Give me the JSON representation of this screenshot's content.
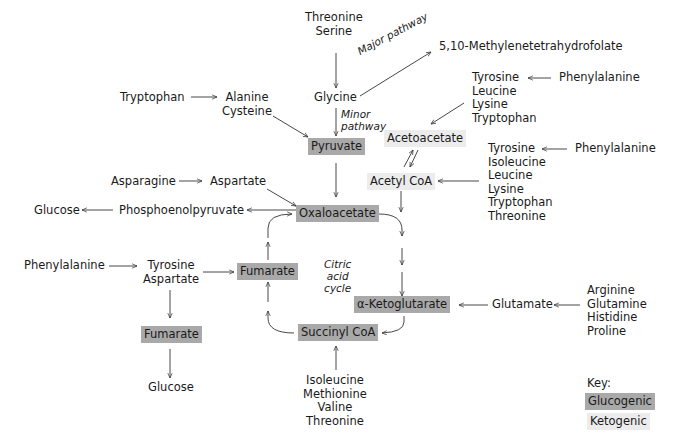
{
  "diagram": {
    "top": {
      "threonine_serine": [
        "Threonine",
        "Serine"
      ],
      "glycine": "Glycine",
      "major_pathway": "Major pathway",
      "minor_pathway": [
        "Minor",
        "pathway"
      ],
      "methylene": "5,10-Methylenetetrahydrofolate",
      "tryptophan": "Tryptophan",
      "alanine_cysteine": [
        "Alanine",
        "Cysteine"
      ]
    },
    "ketogenic_group1": {
      "amino_acids": [
        "Tyrosine",
        "Leucine",
        "Lysine",
        "Tryptophan"
      ],
      "precursor": "Phenylalanine"
    },
    "ketogenic_group2": {
      "amino_acids": [
        "Tyrosine",
        "Isoleucine",
        "Leucine",
        "Lysine",
        "Tryptophan",
        "Threonine"
      ],
      "precursor": "Phenylalanine"
    },
    "boxes": {
      "pyruvate": "Pyruvate",
      "acetoacetate": "Acetoacetate",
      "acetyl_coa": "Acetyl CoA",
      "oxaloacetate": "Oxaloacetate",
      "fumarate_cycle": "Fumarate",
      "fumarate_side": "Fumarate",
      "alpha_ketoglutarate": "α-Ketoglutarate",
      "succinyl_coa": "Succinyl CoA"
    },
    "left": {
      "asparagine": "Asparagine",
      "aspartate": "Aspartate",
      "glucose_top": "Glucose",
      "pep": "Phosphoenolpyruvate",
      "phenylalanine": "Phenylalanine",
      "tyrosine_aspartate": [
        "Tyrosine",
        "Aspartate"
      ],
      "glucose_bottom": "Glucose"
    },
    "cycle_label": [
      "Citric",
      "acid",
      "cycle"
    ],
    "right": {
      "glutamate": "Glutamate",
      "amino_acids": [
        "Arginine",
        "Glutamine",
        "Histidine",
        "Proline"
      ]
    },
    "bottom": {
      "amino_acids": [
        "Isoleucine",
        "Methionine",
        "Valine",
        "Threonine"
      ]
    },
    "key": {
      "title": "Key:",
      "glucogenic": "Glucogenic",
      "ketogenic": "Ketogenic"
    },
    "colors": {
      "glucogenic": "#a9a9a9",
      "ketogenic": "#ececec",
      "arrow": "#333333"
    }
  }
}
